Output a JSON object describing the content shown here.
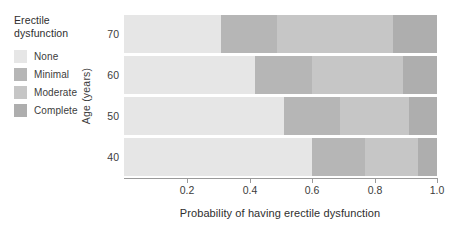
{
  "legend": {
    "title_line1": "Erectile",
    "title_line2": "dysfunction",
    "items": [
      {
        "label": "None",
        "color": "#e6e6e6"
      },
      {
        "label": "Minimal",
        "color": "#b6b6b6"
      },
      {
        "label": "Moderate",
        "color": "#c6c6c6"
      },
      {
        "label": "Complete",
        "color": "#aeaeae"
      }
    ]
  },
  "axes": {
    "x_title": "Probability of having erectile dysfunction",
    "y_title": "Age (years)",
    "x_ticks": [
      "0.2",
      "0.4",
      "0.6",
      "0.8",
      "1.0"
    ],
    "y_ticks": [
      "70",
      "60",
      "50",
      "40"
    ]
  },
  "chart_data": {
    "type": "bar",
    "orientation": "horizontal",
    "stacked": true,
    "normalized": true,
    "title": "",
    "xlabel": "Probability of having erectile dysfunction",
    "ylabel": "Age (years)",
    "xlim": [
      0,
      1.0
    ],
    "xticks": [
      0.2,
      0.4,
      0.6,
      0.8,
      1.0
    ],
    "grid": false,
    "legend_position": "outside-left",
    "legend_title": "Erectile dysfunction",
    "categories": [
      "70",
      "60",
      "50",
      "40"
    ],
    "series": [
      {
        "name": "None",
        "color": "#e6e6e6",
        "values": [
          0.31,
          0.42,
          0.51,
          0.6
        ]
      },
      {
        "name": "Minimal",
        "color": "#b6b6b6",
        "values": [
          0.18,
          0.18,
          0.18,
          0.17
        ]
      },
      {
        "name": "Moderate",
        "color": "#c6c6c6",
        "values": [
          0.37,
          0.29,
          0.22,
          0.17
        ]
      },
      {
        "name": "Complete",
        "color": "#aeaeae",
        "values": [
          0.14,
          0.11,
          0.09,
          0.06
        ]
      }
    ],
    "cumulative_boundaries": {
      "70": [
        0.31,
        0.49,
        0.86,
        1.0
      ],
      "60": [
        0.42,
        0.6,
        0.89,
        1.0
      ],
      "50": [
        0.51,
        0.69,
        0.91,
        1.0
      ],
      "40": [
        0.6,
        0.77,
        0.94,
        1.0
      ]
    }
  }
}
